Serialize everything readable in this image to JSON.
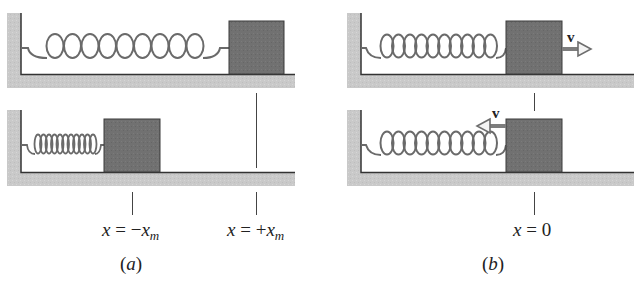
{
  "figure": {
    "colors": {
      "wall_floor": "#c8c8c8",
      "block": "#707070",
      "block_border": "#3a3a3a",
      "spring": "#6a6a6a",
      "line": "#333333",
      "arrow": "#888888"
    },
    "panel_a": {
      "caption": "a",
      "top_row": {
        "spring_coils": 9,
        "state": "stretched",
        "block_position": "+x_m"
      },
      "bottom_row": {
        "spring_coils": 11,
        "state": "compressed",
        "block_position": "-x_m"
      },
      "labels": {
        "left": {
          "lhs": "x",
          "eq": "=",
          "sign": "−",
          "var": "x",
          "sub": "m"
        },
        "right": {
          "lhs": "x",
          "eq": "=",
          "sign": "+",
          "var": "x",
          "sub": "m"
        }
      }
    },
    "panel_b": {
      "caption": "b",
      "top_row": {
        "spring_coils": 10,
        "velocity_label": "v",
        "velocity_direction": "right"
      },
      "bottom_row": {
        "spring_coils": 10,
        "velocity_label": "v",
        "velocity_direction": "left"
      },
      "labels": {
        "center": {
          "lhs": "x",
          "eq": "=",
          "value": "0"
        }
      }
    }
  }
}
